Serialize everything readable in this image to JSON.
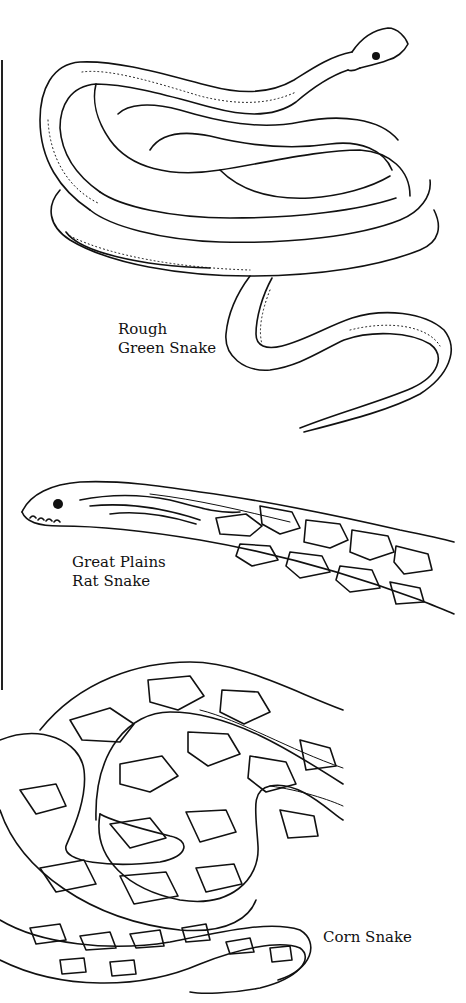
{
  "page": {
    "type": "coloring-book illustration page",
    "background": "#ffffff",
    "ink": "#111111"
  },
  "illustrations": [
    {
      "id": "rough-green-snake",
      "label_lines": [
        "Rough",
        "Green Snake"
      ],
      "pattern": "plain with dotted lateral line"
    },
    {
      "id": "great-plains-rat-snake",
      "label_lines": [
        "Great Plains",
        "Rat Snake"
      ],
      "pattern": "blotched"
    },
    {
      "id": "corn-snake",
      "label_lines": [
        "Corn Snake"
      ],
      "pattern": "large outlined saddle blotches"
    }
  ]
}
